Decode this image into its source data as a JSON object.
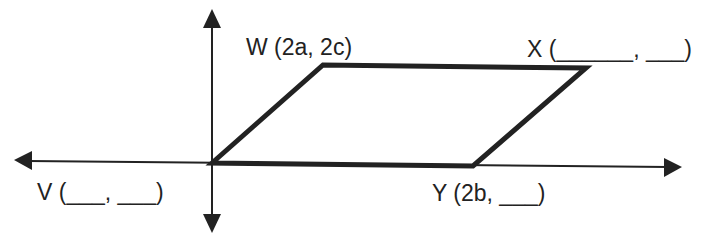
{
  "diagram": {
    "type": "coordinate-geometry-parallelogram",
    "axes": {
      "origin": [
        212,
        163
      ],
      "x_axis": {
        "from": [
          15,
          161
        ],
        "to": [
          682,
          167
        ]
      },
      "y_axis": {
        "from": [
          212,
          10
        ],
        "to": [
          212,
          232
        ]
      },
      "color": "#222222"
    },
    "parallelogram": {
      "vertices": {
        "V": [
          212,
          163
        ],
        "W": [
          323,
          65
        ],
        "X": [
          586,
          68
        ],
        "Y": [
          473,
          166
        ]
      },
      "stroke": "#222222",
      "stroke_width": 5
    },
    "labels": {
      "W": "W (2a, 2c)",
      "X": "X (______, ___)",
      "V": "V (___, ___)",
      "Y": "Y (2b, ___)"
    },
    "label_positions": {
      "W": [
        246,
        55
      ],
      "X": [
        527,
        57
      ],
      "V": [
        37,
        200
      ],
      "Y": [
        432,
        201
      ]
    }
  }
}
